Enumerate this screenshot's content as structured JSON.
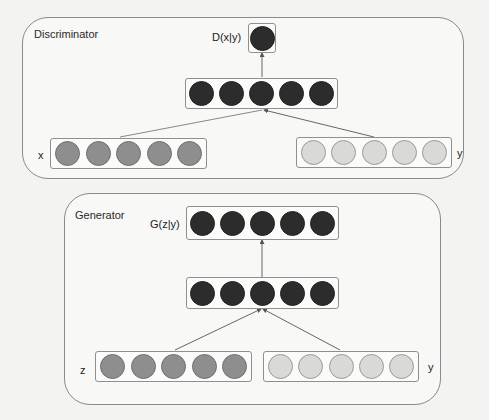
{
  "discriminator": {
    "title": "Discriminator",
    "output_label": "D(x|y)",
    "input_x_label": "x",
    "input_y_label": "y",
    "layers": [
      {
        "name": "output",
        "nodes": 1,
        "shade": "dark"
      },
      {
        "name": "hidden",
        "nodes": 5,
        "shade": "dark"
      },
      {
        "name": "x-input",
        "nodes": 5,
        "shade": "mid"
      },
      {
        "name": "y-input",
        "nodes": 5,
        "shade": "light"
      }
    ]
  },
  "generator": {
    "title": "Generator",
    "output_label": "G(z|y)",
    "input_z_label": "z",
    "input_y_label": "y",
    "layers": [
      {
        "name": "output",
        "nodes": 5,
        "shade": "dark"
      },
      {
        "name": "hidden",
        "nodes": 5,
        "shade": "dark"
      },
      {
        "name": "z-input",
        "nodes": 5,
        "shade": "mid"
      },
      {
        "name": "y-input",
        "nodes": 5,
        "shade": "light"
      }
    ]
  },
  "colors": {
    "dark_node": "#2c2c2c",
    "mid_node": "#8e8e8e",
    "light_node": "#d9d9d7",
    "border": "#8a8a8a"
  }
}
